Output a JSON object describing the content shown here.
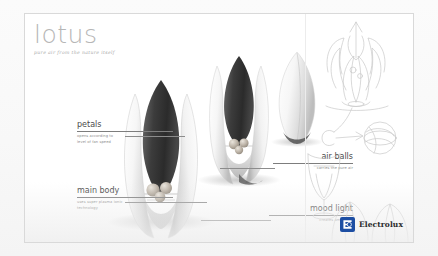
{
  "poster": {
    "brand_title": "lotus",
    "tagline": "pure air from the nature itself",
    "accent_color": "#1d4ea3",
    "board_bg": "#ffffff",
    "text_color": "#4a4a4a"
  },
  "callouts": [
    {
      "id": "petals",
      "title": "petals",
      "description": "opens according to\nlevel of fan speed"
    },
    {
      "id": "main-body",
      "title": "main body",
      "description": "uses super plasma ionic\ntechnology"
    },
    {
      "id": "air-balls",
      "title": "air balls",
      "description": "carries the pure air"
    },
    {
      "id": "mood-light",
      "title": "mood light",
      "description": "creates ambience"
    }
  ],
  "renderings": [
    {
      "id": "bud-open-front",
      "state": "open",
      "description": "lotus bud air purifier, petals open"
    },
    {
      "id": "bud-open-mid",
      "state": "open",
      "description": "lotus bud air purifier, petals open"
    },
    {
      "id": "bud-closed",
      "state": "closed",
      "description": "lotus bud air purifier, petals closed"
    }
  ],
  "sketches": [
    {
      "id": "sketch-lotus-bloom",
      "description": "pencil sketch of blooming lotus"
    },
    {
      "id": "sketch-air-ball",
      "description": "pencil sketch of air ball sphere"
    },
    {
      "id": "sketch-vessel",
      "description": "pencil sketch of vessel base"
    },
    {
      "id": "sketch-petals-row",
      "description": "pencil sketch of petal row"
    }
  ],
  "logo": {
    "wordmark": "Electrolux",
    "mark_name": "electrolux-e-mark"
  }
}
